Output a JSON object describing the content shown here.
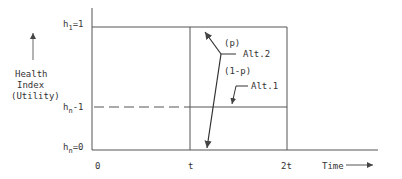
{
  "y_axis": {
    "title_lines": [
      "Health",
      "Index",
      "(Utility)"
    ],
    "levels": [
      {
        "prefix": "h",
        "sub": "1",
        "suffix": "=1"
      },
      {
        "prefix": "h",
        "sub": "n",
        "suffix": "-1"
      },
      {
        "prefix": "h",
        "sub": "n",
        "suffix": "=0"
      }
    ]
  },
  "x_axis": {
    "ticks": [
      "0",
      "t",
      "2t"
    ],
    "title": "Time",
    "title_arrow": "———>"
  },
  "annotations": {
    "p": "(p)",
    "one_minus_p": "(1-p)",
    "alt2": "Alt.2",
    "alt1": "Alt.1"
  },
  "colors": {
    "line": "#444444",
    "text": "#333333"
  }
}
